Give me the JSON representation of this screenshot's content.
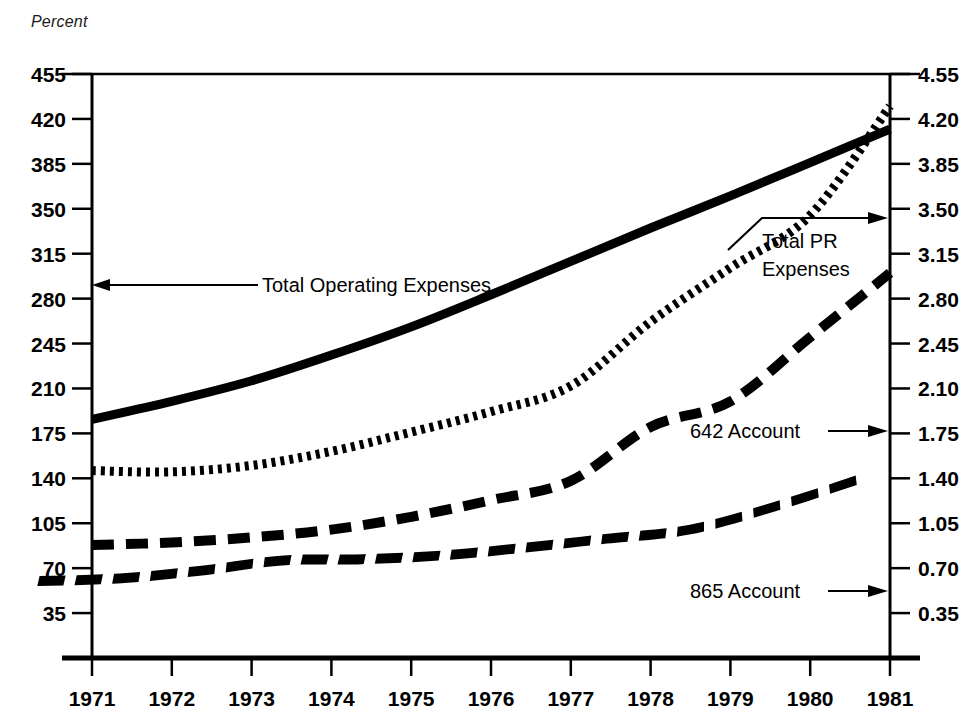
{
  "chart_data": {
    "type": "line",
    "title": "",
    "ylabel": "Percent",
    "xlabel": "",
    "grid": false,
    "legend_position": "inline-annotations",
    "x": [
      1971,
      1972,
      1973,
      1974,
      1975,
      1976,
      1977,
      1978,
      1979,
      1980,
      1981
    ],
    "xlim": [
      1971,
      1981
    ],
    "xtick_labels": [
      "1971",
      "1972",
      "1973",
      "1974",
      "1975",
      "1976",
      "1977",
      "1978",
      "1979",
      "1980",
      "1981"
    ],
    "left_axis": {
      "ylim": [
        0,
        455
      ],
      "ticks": [
        455,
        420,
        385,
        350,
        315,
        280,
        245,
        210,
        175,
        140,
        105,
        70,
        35
      ],
      "tick_labels": [
        "455",
        "420",
        "385",
        "350",
        "315",
        "280",
        "245",
        "210",
        "175",
        "140",
        "105",
        "70",
        "35"
      ]
    },
    "right_axis": {
      "ylim": [
        0,
        4.55
      ],
      "ticks": [
        4.55,
        4.2,
        3.85,
        3.5,
        3.15,
        2.8,
        2.45,
        2.1,
        1.75,
        1.4,
        1.05,
        0.7,
        0.35
      ],
      "tick_labels": [
        "4.55",
        "4.20",
        "3.85",
        "3.50",
        "3.15",
        "2.80",
        "2.45",
        "2.10",
        "1.75",
        "1.40",
        "1.05",
        "0.70",
        "0.35"
      ]
    },
    "series": [
      {
        "name": "Total Operating Expenses",
        "style": "solid",
        "axis": "left",
        "values": [
          186,
          200,
          216,
          236,
          258,
          283,
          309,
          335,
          360,
          386,
          412
        ]
      },
      {
        "name": "Total PR Expenses",
        "style": "dotted",
        "axis": "left",
        "values": [
          146,
          145,
          150,
          161,
          176,
          192,
          212,
          262,
          304,
          345,
          430
        ]
      },
      {
        "name": "642 Account",
        "style": "dashed",
        "axis": "left",
        "values": [
          88,
          90,
          94,
          100,
          110,
          123,
          138,
          180,
          200,
          250,
          300
        ]
      },
      {
        "name": "865 Account",
        "style": "slant-dash",
        "axis": "left",
        "values": [
          60,
          62,
          68,
          76,
          77,
          80,
          86,
          93,
          100,
          118,
          140
        ]
      }
    ],
    "annotations": [
      {
        "id": "total-operating-expenses",
        "text": "Total Operating Expenses",
        "arrow": "left"
      },
      {
        "id": "total-pr-expenses",
        "text_line_1": "Total PR",
        "text_line_2": "Expenses",
        "arrow": "right-bent"
      },
      {
        "id": "642-account",
        "text": "642 Account",
        "arrow": "right"
      },
      {
        "id": "865-account",
        "text": "865 Account",
        "arrow": "right"
      }
    ],
    "colors": {
      "ink": "#000000",
      "background": "#ffffff"
    }
  }
}
